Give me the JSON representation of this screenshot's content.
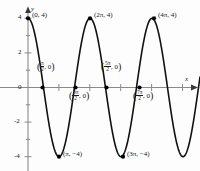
{
  "figure": {
    "kind": "cartesian-graph",
    "axis_labels": {
      "x": "x",
      "y": "y"
    },
    "colors": {
      "curve": "#000000",
      "axis": "#808080",
      "text": "#1a1a1a",
      "point": "#000000"
    }
  },
  "chart_data": {
    "type": "line",
    "title": "",
    "xlabel": "x",
    "ylabel": "y",
    "xlim": [
      -0.9,
      14.6
    ],
    "ylim": [
      -5.2,
      4.9
    ],
    "grid": false,
    "legend": null,
    "function": "y = 4 cos(x)",
    "amplitude": 4,
    "period": "2π",
    "y_ticks": [
      4,
      2,
      0,
      -2,
      -4
    ],
    "y_tick_labels": [
      "4",
      "2",
      "0",
      "-2",
      "-4"
    ],
    "x_ticks_unlabeled": true,
    "x": [
      0,
      1.5707963,
      3.1415927,
      4.712389,
      6.2831853,
      7.8539816,
      9.424778,
      10.9955743,
      12.5663706
    ],
    "values": [
      4,
      0,
      -4,
      0,
      4,
      0,
      -4,
      0,
      4
    ],
    "annotations": [
      {
        "id": "max-0",
        "x": 0,
        "y": 4,
        "text_plain": "(0, 4)",
        "prefix": "(0, 4)",
        "has_fraction": false,
        "position": "upper-right"
      },
      {
        "id": "zero-1",
        "x": 1.5707963,
        "y": 0,
        "text_plain": "(π/2, 0)",
        "num": "π",
        "den": "2",
        "suffix": ", 0",
        "has_fraction": true,
        "position": "above"
      },
      {
        "id": "min-1",
        "x": 3.1415927,
        "y": -4,
        "text_plain": "(π, -4)",
        "prefix": "(π, −4)",
        "has_fraction": false,
        "position": "right"
      },
      {
        "id": "zero-2",
        "x": 4.712389,
        "y": 0,
        "text_plain": "(3π/2, 0)",
        "num": "3π",
        "den": "2",
        "suffix": ", 0",
        "has_fraction": true,
        "position": "below"
      },
      {
        "id": "max-1",
        "x": 6.2831853,
        "y": 4,
        "text_plain": "(2π, 4)",
        "prefix": "(2π, 4)",
        "has_fraction": false,
        "position": "upper-right"
      },
      {
        "id": "zero-3",
        "x": 7.8539816,
        "y": 0,
        "text_plain": "(5π/2, 0)",
        "num": "5π",
        "den": "2",
        "suffix": ", 0",
        "has_fraction": true,
        "position": "above"
      },
      {
        "id": "min-2",
        "x": 9.424778,
        "y": -4,
        "text_plain": "(3π, -4)",
        "prefix": "(3π, −4)",
        "has_fraction": false,
        "position": "right"
      },
      {
        "id": "zero-4",
        "x": 10.9955743,
        "y": 0,
        "text_plain": "(7π/2, 0)",
        "num": "7π",
        "den": "2",
        "suffix": ", 0",
        "has_fraction": true,
        "position": "below"
      },
      {
        "id": "max-2",
        "x": 12.5663706,
        "y": 4,
        "text_plain": "(4π, 4)",
        "prefix": "(4π, 4)",
        "has_fraction": false,
        "position": "upper-right"
      }
    ]
  },
  "ticks": {
    "y4": "4",
    "y2": "2",
    "y0": "0",
    "ym2": "-2",
    "ym4": "-4"
  },
  "axis": {
    "x_name": "x",
    "y_name": "y"
  },
  "points": {
    "p0": {
      "prefix": "(0, 4)"
    },
    "p1": {
      "num": "π",
      "den": "2",
      "suffix": ", 0"
    },
    "p2": {
      "prefix": "(π, −4)"
    },
    "p3": {
      "num": "3π",
      "den": "2",
      "suffix": ", 0"
    },
    "p4": {
      "prefix": "(2π, 4)"
    },
    "p5": {
      "num": "5π",
      "den": "2",
      "suffix": ", 0"
    },
    "p6": {
      "prefix": "(3π, −4)"
    },
    "p7": {
      "num": "7π",
      "den": "2",
      "suffix": ", 0"
    },
    "p8": {
      "prefix": "(4π, 4)"
    }
  }
}
